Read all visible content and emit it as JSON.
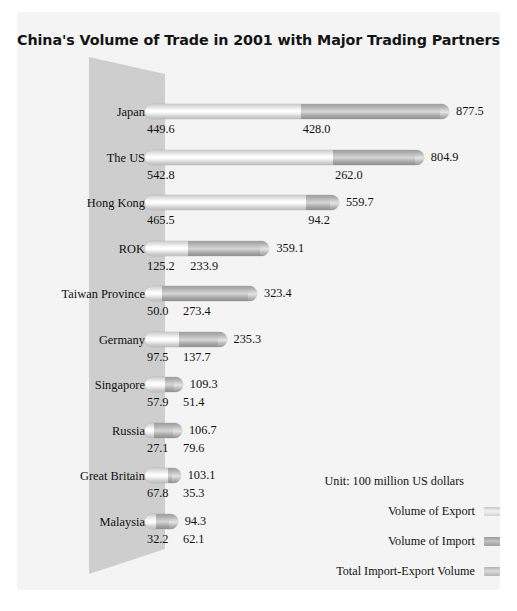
{
  "chart_data": {
    "type": "bar",
    "title": "China's Volume of Trade in 2001  with Major Trading Partners",
    "xlabel": "",
    "ylabel": "",
    "unit_note": "Unit: 100 million US dollars",
    "orientation": "horizontal",
    "stacked": true,
    "grid": false,
    "legend_position": "bottom-right",
    "xlim": [
      0,
      877.5
    ],
    "categories": [
      "Japan",
      "The US",
      "Hong Kong",
      "ROK",
      "Taiwan Province",
      "Germany",
      "Singapore",
      "Russia",
      "Great Britain",
      "Malaysia"
    ],
    "series": [
      {
        "name": "Volume of Export",
        "values": [
          449.6,
          542.8,
          465.5,
          125.2,
          50.0,
          97.5,
          57.9,
          27.1,
          67.8,
          32.2
        ]
      },
      {
        "name": "Volume of Import",
        "values": [
          428.0,
          262.0,
          94.2,
          233.9,
          273.4,
          137.7,
          51.4,
          79.6,
          35.3,
          62.1
        ]
      },
      {
        "name": "Total Import-Export Volume",
        "values": [
          877.5,
          804.9,
          559.7,
          359.1,
          323.4,
          235.3,
          109.3,
          106.7,
          103.1,
          94.3
        ]
      }
    ],
    "rows": [
      {
        "category": "Japan",
        "export": "449.6",
        "import": "428.0",
        "total": "877.5",
        "export_num": 449.6,
        "import_num": 428.0,
        "total_num": 877.5
      },
      {
        "category": "The US",
        "export": "542.8",
        "import": "262.0",
        "total": "804.9",
        "export_num": 542.8,
        "import_num": 262.0,
        "total_num": 804.9
      },
      {
        "category": "Hong Kong",
        "export": "465.5",
        "import": "94.2",
        "total": "559.7",
        "export_num": 465.5,
        "import_num": 94.2,
        "total_num": 559.7
      },
      {
        "category": "ROK",
        "export": "125.2",
        "import": "233.9",
        "total": "359.1",
        "export_num": 125.2,
        "import_num": 233.9,
        "total_num": 359.1
      },
      {
        "category": "Taiwan Province",
        "export": "50.0",
        "import": "273.4",
        "total": "323.4",
        "export_num": 50.0,
        "import_num": 273.4,
        "total_num": 323.4
      },
      {
        "category": "Germany",
        "export": "97.5",
        "import": "137.7",
        "total": "235.3",
        "export_num": 97.5,
        "import_num": 137.7,
        "total_num": 235.3
      },
      {
        "category": "Singapore",
        "export": "57.9",
        "import": "51.4",
        "total": "109.3",
        "export_num": 57.9,
        "import_num": 51.4,
        "total_num": 109.3
      },
      {
        "category": "Russia",
        "export": "27.1",
        "import": "79.6",
        "total": "106.7",
        "export_num": 27.1,
        "import_num": 79.6,
        "total_num": 106.7
      },
      {
        "category": "Great Britain",
        "export": "67.8",
        "import": "35.3",
        "total": "103.1",
        "export_num": 67.8,
        "import_num": 35.3,
        "total_num": 103.1
      },
      {
        "category": "Malaysia",
        "export": "32.2",
        "import": "62.1",
        "total": "94.3",
        "export_num": 32.2,
        "import_num": 62.1,
        "total_num": 94.3
      }
    ]
  },
  "legend": {
    "unit": "Unit: 100 million US dollars",
    "items": [
      {
        "label": "Volume of Export",
        "swatch": "sw-export",
        "color": "#eaeaea"
      },
      {
        "label": "Volume of Import",
        "swatch": "sw-import",
        "color": "#b4b4b4"
      },
      {
        "label": "Total Import-Export Volume",
        "swatch": "sw-total",
        "color": "#cfcfcf"
      }
    ]
  },
  "colors": {
    "panel_background": "#f4f4f4",
    "page_background": "#ffffff",
    "trapezoid": "#c6c6c6",
    "export_bar": "#ededed",
    "import_bar": "#b6b6b6",
    "text": "#111111"
  }
}
